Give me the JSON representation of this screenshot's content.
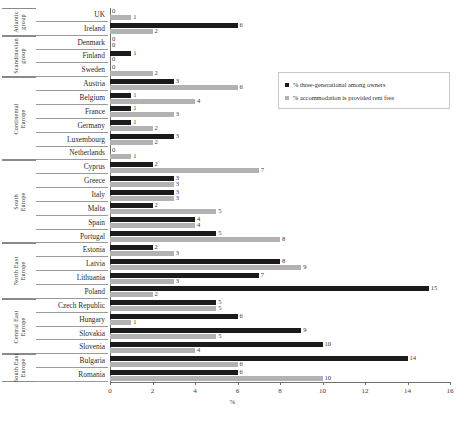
{
  "chart_data": {
    "type": "bar",
    "orientation": "horizontal",
    "title": "",
    "xlabel": "%",
    "ylabel": "",
    "xlim": [
      0,
      16
    ],
    "xticks": [
      0,
      2,
      4,
      6,
      8,
      10,
      12,
      14,
      16
    ],
    "grid": false,
    "legend_position": "right",
    "series": [
      {
        "name": "% three-generational among owners",
        "color": "#1b1b1b",
        "values": [
          0,
          6,
          0,
          1,
          0,
          3,
          1,
          1,
          1,
          3,
          0,
          2,
          3,
          3,
          2,
          4,
          5,
          2,
          8,
          7,
          15,
          5,
          6,
          9,
          10,
          14,
          6
        ]
      },
      {
        "name": "% accommodation is provided rent free",
        "color": "#b2b2b2",
        "values": [
          1,
          2,
          0,
          0,
          2,
          6,
          4,
          3,
          2,
          2,
          1,
          7,
          3,
          3,
          5,
          4,
          8,
          3,
          9,
          3,
          2,
          5,
          1,
          5,
          4,
          6,
          10
        ]
      }
    ],
    "categories": [
      "UK",
      "Ireland",
      "Denmark",
      "Finland",
      "Sweden",
      "Austria",
      "Belgium",
      "France",
      "Germany",
      "Luxembourg",
      "Netherlands",
      "Cyprus",
      "Greece",
      "Italy",
      "Malta",
      "Spain",
      "Portugal",
      "Estonia",
      "Latvia",
      "Lithuania",
      "Poland",
      "Czech Republic",
      "Hungary",
      "Slovakia",
      "Slovenia",
      "Bulgaria",
      "Romania"
    ],
    "groups": [
      {
        "label": "Atlantic group",
        "start": 0,
        "count": 2
      },
      {
        "label": "Scandinavian group",
        "start": 2,
        "count": 3
      },
      {
        "label": "Continental Europe",
        "start": 5,
        "count": 6
      },
      {
        "label": "South Europe",
        "start": 11,
        "count": 6
      },
      {
        "label": "North East Europe",
        "start": 17,
        "count": 4
      },
      {
        "label": "Central East Europe",
        "start": 21,
        "count": 4
      },
      {
        "label": "South East Europe",
        "start": 25,
        "count": 2
      }
    ]
  },
  "legend": {
    "items": [
      {
        "label": "% three-generational among owners"
      },
      {
        "label": "% accommodation is provided rent free"
      }
    ]
  },
  "colors": {
    "dark": "#1b1b1b",
    "light": "#b2b2b2",
    "axis": "#6f6f6f",
    "background": "#ffffff"
  }
}
